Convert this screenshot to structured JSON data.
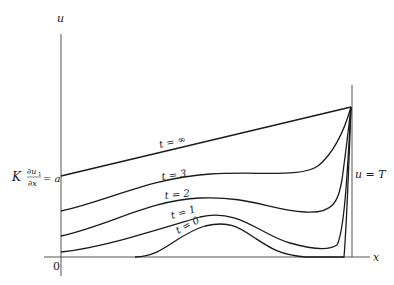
{
  "diagram": {
    "axes": {
      "y_label": "u",
      "x_label": "x",
      "origin_label": "0"
    },
    "left_boundary_condition": {
      "K": "K",
      "numerator": "∂u",
      "numerator_sub": "1",
      "denominator": "∂x",
      "rhs": "= a"
    },
    "right_boundary_condition": "u = T",
    "curves": [
      {
        "label": "t = ∞"
      },
      {
        "label": "t = 3"
      },
      {
        "label": "t = 2"
      },
      {
        "label": "t = 1"
      },
      {
        "label": "t = 0"
      }
    ]
  }
}
